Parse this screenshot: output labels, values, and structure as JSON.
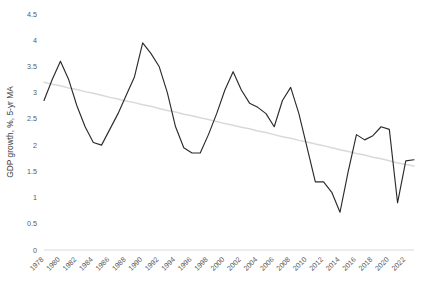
{
  "chart_data": {
    "type": "line",
    "title": "",
    "subtitle": "",
    "xlabel": "",
    "ylabel": "GDP growth, %, 5-yr MA",
    "xlim": [
      1978,
      2023
    ],
    "ylim": [
      0,
      4.5
    ],
    "y_ticks": [
      "0",
      "0.5",
      "1",
      "1.5",
      "2",
      "2.5",
      "3",
      "3.5",
      "4",
      "4.5"
    ],
    "y_tick_values": [
      0,
      0.5,
      1,
      1.5,
      2,
      2.5,
      3,
      3.5,
      4,
      4.5
    ],
    "x_ticks": [
      "1978",
      "1980",
      "1982",
      "1984",
      "1986",
      "1988",
      "1990",
      "1992",
      "1994",
      "1996",
      "1998",
      "2000",
      "2002",
      "2004",
      "2006",
      "2008",
      "2010",
      "2012",
      "2014",
      "2016",
      "2018",
      "2020",
      "2022"
    ],
    "grid": false,
    "legend": "none",
    "x": [
      1978,
      1979,
      1980,
      1981,
      1982,
      1983,
      1984,
      1985,
      1986,
      1987,
      1988,
      1989,
      1990,
      1991,
      1992,
      1993,
      1994,
      1995,
      1996,
      1997,
      1998,
      1999,
      2000,
      2001,
      2002,
      2003,
      2004,
      2005,
      2006,
      2007,
      2008,
      2009,
      2010,
      2011,
      2012,
      2013,
      2014,
      2015,
      2016,
      2017,
      2018,
      2019,
      2020,
      2021,
      2022,
      2023
    ],
    "series": [
      {
        "name": "GDP growth, %, 5-yr MA",
        "color": "#2b2b2b",
        "values": [
          2.85,
          3.25,
          3.6,
          3.25,
          2.75,
          2.35,
          2.05,
          2.0,
          2.3,
          2.6,
          2.95,
          3.3,
          3.95,
          3.75,
          3.5,
          3.0,
          2.35,
          1.95,
          1.85,
          1.85,
          2.2,
          2.6,
          3.05,
          3.4,
          3.05,
          2.8,
          2.72,
          2.6,
          2.35,
          2.85,
          3.1,
          2.6,
          1.95,
          1.3,
          1.3,
          1.1,
          0.72,
          1.5,
          2.2,
          2.1,
          2.18,
          2.35,
          2.3,
          0.9,
          1.7,
          1.72
        ]
      },
      {
        "name": "linear trend",
        "color": "#d9d9d9",
        "values": [
          3.2,
          3.16,
          3.13,
          3.09,
          3.06,
          3.02,
          2.99,
          2.95,
          2.91,
          2.88,
          2.84,
          2.81,
          2.77,
          2.74,
          2.7,
          2.66,
          2.63,
          2.59,
          2.56,
          2.52,
          2.49,
          2.45,
          2.41,
          2.38,
          2.34,
          2.31,
          2.27,
          2.24,
          2.2,
          2.16,
          2.13,
          2.09,
          2.06,
          2.02,
          1.99,
          1.95,
          1.91,
          1.88,
          1.84,
          1.81,
          1.77,
          1.74,
          1.7,
          1.66,
          1.63,
          1.6
        ]
      }
    ]
  }
}
